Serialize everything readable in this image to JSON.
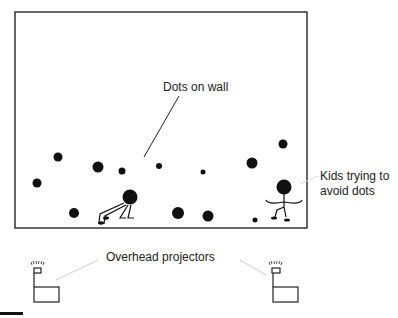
{
  "diagram": {
    "wall_frame": {
      "x": 15,
      "y": 12,
      "width": 292,
      "height": 216,
      "stroke": "#333333"
    },
    "labels": {
      "dots_on_wall": "Dots on wall",
      "kids_line1": "Kids trying to",
      "kids_line2": "avoid dots",
      "projectors": "Overhead projectors"
    },
    "dots": [
      {
        "cx": 58,
        "cy": 157,
        "r": 4.5
      },
      {
        "cx": 98,
        "cy": 167,
        "r": 5.5
      },
      {
        "cx": 122,
        "cy": 171,
        "r": 3.5
      },
      {
        "cx": 159,
        "cy": 166,
        "r": 3
      },
      {
        "cx": 37,
        "cy": 183,
        "r": 4.5
      },
      {
        "cx": 74,
        "cy": 213,
        "r": 5
      },
      {
        "cx": 178,
        "cy": 213,
        "r": 6
      },
      {
        "cx": 208,
        "cy": 216,
        "r": 5.5
      },
      {
        "cx": 203,
        "cy": 172,
        "r": 2.5
      },
      {
        "cx": 252,
        "cy": 163,
        "r": 5.5
      },
      {
        "cx": 283,
        "cy": 144,
        "r": 4.5
      },
      {
        "cx": 255,
        "cy": 220,
        "r": 2.5
      }
    ],
    "kids": [
      {
        "pose": "crouching",
        "head": {
          "cx": 130,
          "cy": 197,
          "r": 7.5
        }
      },
      {
        "pose": "standing",
        "head": {
          "cx": 284,
          "cy": 187,
          "r": 7.5
        }
      }
    ],
    "projectors": [
      {
        "side": "left",
        "x": 34
      },
      {
        "side": "right",
        "x": 272
      }
    ],
    "colors": {
      "ink": "#111111",
      "leader": "#cccccc",
      "frame": "#333333"
    }
  }
}
